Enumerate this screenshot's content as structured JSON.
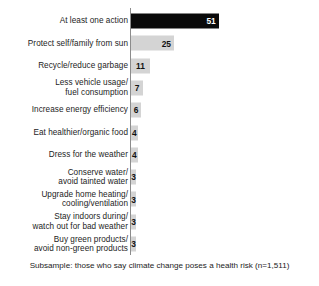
{
  "chart_data": {
    "type": "bar",
    "orientation": "horizontal",
    "title": "",
    "xlabel": "",
    "ylabel": "",
    "xlim": [
      0,
      55
    ],
    "grid": false,
    "legend": "none",
    "categories": [
      "At least one action",
      "Protect self/family from sun",
      "Recycle/reduce garbage",
      "Less vehicle usage/\nfuel consumption",
      "Increase energy efficiency",
      "Eat healthier/organic food",
      "Dress for the weather",
      "Conserve water/\navoid tainted water",
      "Upgrade home heating/\ncooling/ventilation",
      "Stay indoors during/\nwatch out for bad weather",
      "Buy green products/\navoid non-green products"
    ],
    "values": [
      51,
      25,
      11,
      7,
      6,
      4,
      4,
      3,
      3,
      3,
      3
    ],
    "value_labels": [
      "51",
      "25",
      "11",
      "7",
      "6",
      "4",
      "4",
      "3",
      "3",
      "3",
      "3"
    ],
    "bar_colors": [
      "#0a0a0a",
      "#d4d4d4",
      "#d4d4d4",
      "#d4d4d4",
      "#d4d4d4",
      "#d4d4d4",
      "#d4d4d4",
      "#d4d4d4",
      "#d4d4d4",
      "#d4d4d4",
      "#d4d4d4"
    ],
    "highlight_index": 0,
    "annotations": [
      "Subsample: those who say climate change poses a health risk (n=1,511)"
    ]
  },
  "rows": [
    {
      "label": "At least one action",
      "value_label": "51"
    },
    {
      "label": "Protect self/family from sun",
      "value_label": "25"
    },
    {
      "label": "Recycle/reduce garbage",
      "value_label": "11"
    },
    {
      "label": "Less vehicle usage/\nfuel consumption",
      "value_label": "7"
    },
    {
      "label": "Increase energy efficiency",
      "value_label": "6"
    },
    {
      "label": "Eat healthier/organic food",
      "value_label": "4"
    },
    {
      "label": "Dress for the weather",
      "value_label": "4"
    },
    {
      "label": "Conserve water/\navoid tainted water",
      "value_label": "3"
    },
    {
      "label": "Upgrade home heating/\ncooling/ventilation",
      "value_label": "3"
    },
    {
      "label": "Stay indoors during/\nwatch out for bad weather",
      "value_label": "3"
    },
    {
      "label": "Buy green products/\navoid non-green products",
      "value_label": "3"
    }
  ],
  "footnote": {
    "text": "Subsample: those who say climate change poses a health risk (n=1,511)"
  },
  "colors": {
    "bar_default": "#d4d4d4",
    "bar_highlight": "#0a0a0a",
    "axis": "#8c8c8c",
    "text": "#1c1c1c",
    "background": "#ffffff"
  }
}
